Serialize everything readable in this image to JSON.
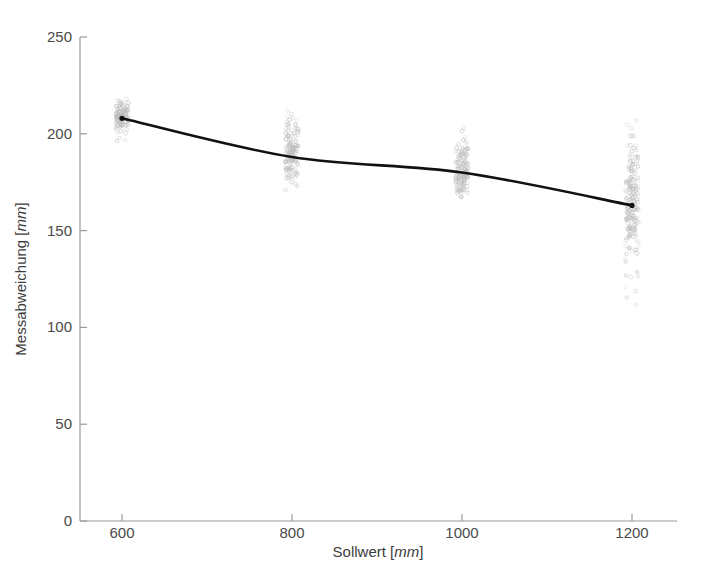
{
  "figure": {
    "background_color": "#ffffff",
    "line_color": "#111111",
    "marker_color": "#b9b9b9",
    "axis_color": "#9a9a9a",
    "tick_label_color": "#4a4a4a"
  },
  "axes": {
    "x_title_main": "Sollwert [",
    "x_title_unit": "mm",
    "x_title_close": "]",
    "y_title_main": "Messabweichung [",
    "y_title_unit": "mm",
    "y_title_close": "]",
    "x_ticks": [
      "600",
      "800",
      "1000",
      "1200"
    ],
    "y_ticks": [
      "0",
      "50",
      "100",
      "150",
      "200",
      "250"
    ]
  },
  "chart_data": {
    "type": "scatter",
    "title": "",
    "subtitle": "",
    "xlabel": "Sollwert [mm]",
    "ylabel": "Messabweichung [mm]",
    "xlim": [
      530,
      1255
    ],
    "ylim": [
      0,
      250
    ],
    "grid": false,
    "legend": null,
    "x_ticks": [
      600,
      800,
      1000,
      1200
    ],
    "y_ticks": [
      0,
      50,
      100,
      150,
      200,
      250
    ],
    "series": [
      {
        "name": "Messpunkte",
        "type": "scatter",
        "marker": "circle-open",
        "marker_color": "#b9b9b9",
        "marker_size": 3,
        "groups": [
          {
            "x": 600,
            "x_jitter_width": 13,
            "y_min": 195,
            "y_max": 220,
            "y_median": 209,
            "n": 120
          },
          {
            "x": 800,
            "x_jitter_width": 13,
            "y_min": 168,
            "y_max": 218,
            "y_median": 190,
            "n": 150
          },
          {
            "x": 1000,
            "x_jitter_width": 13,
            "y_min": 159,
            "y_max": 208,
            "y_median": 181,
            "n": 150
          },
          {
            "x": 1200,
            "x_jitter_width": 13,
            "y_min": 106,
            "y_max": 212,
            "y_median": 165,
            "n": 200
          }
        ]
      },
      {
        "name": "Trendlinie",
        "type": "line",
        "color": "#111111",
        "width": 2.6,
        "x": [
          600,
          800,
          1000,
          1200
        ],
        "values": [
          208,
          188,
          180,
          163
        ]
      }
    ]
  }
}
